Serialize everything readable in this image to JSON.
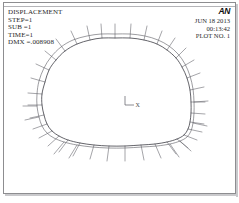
{
  "window": {
    "title": "ANSYS Displacement Plot"
  },
  "legend": {
    "lines": [
      "DISPLACEMENT",
      "STEP=1",
      "SUB =1",
      "TIME=1",
      "DMX =.008908"
    ],
    "title": "DISPLACEMENT",
    "step": "STEP=1",
    "sub": "SUB =1",
    "time": "TIME=1",
    "dmx": "DMX =.008908"
  },
  "stamp": {
    "logo": "AN",
    "date": "JUN 18 2013",
    "time": "00:13:42",
    "plot_no": "PLOT NO.   1"
  },
  "axis_triad": {
    "x_label": "X",
    "origin_x": 121,
    "origin_y": 98,
    "arm_length": 9
  },
  "colors": {
    "line": "#5a5a62",
    "line_dark": "#3c3c44",
    "border": "#8d8d90",
    "border_shadow": "#c9c9cc",
    "text": "#2a2a2a",
    "background": "#ffffff"
  },
  "chart_data": {
    "type": "line",
    "title": "DISPLACEMENT",
    "description": "ANSYS deformed-shape plot of a horseshoe tunnel cross-section with radial rock-bolt elements",
    "xlabel": "X",
    "ylabel": "",
    "legend_position": "top-left",
    "grid": false,
    "viewbox": [
      0,
      0,
      231,
      186
    ],
    "series": [
      {
        "name": "undeformed-outline",
        "closed": true,
        "points": [
          [
            111,
            27
          ],
          [
            126,
            27
          ],
          [
            141,
            29
          ],
          [
            154,
            33
          ],
          [
            165,
            39
          ],
          [
            174,
            47
          ],
          [
            181,
            57
          ],
          [
            186,
            69
          ],
          [
            189,
            82
          ],
          [
            190,
            95
          ],
          [
            190,
            106
          ],
          [
            189,
            116
          ],
          [
            187,
            124
          ],
          [
            183,
            130
          ],
          [
            176,
            134
          ],
          [
            166,
            137
          ],
          [
            153,
            139
          ],
          [
            138,
            140
          ],
          [
            121,
            141
          ],
          [
            104,
            141
          ],
          [
            88,
            140
          ],
          [
            73,
            138
          ],
          [
            60,
            135
          ],
          [
            50,
            131
          ],
          [
            43,
            126
          ],
          [
            38,
            119
          ],
          [
            35,
            110
          ],
          [
            33,
            99
          ],
          [
            33,
            87
          ],
          [
            35,
            74
          ],
          [
            40,
            61
          ],
          [
            47,
            50
          ],
          [
            57,
            40
          ],
          [
            69,
            33
          ],
          [
            83,
            29
          ],
          [
            97,
            27
          ]
        ]
      },
      {
        "name": "deformed-outline",
        "closed": true,
        "points": [
          [
            111,
            31
          ],
          [
            126,
            31
          ],
          [
            140,
            33
          ],
          [
            153,
            37
          ],
          [
            163,
            43
          ],
          [
            172,
            51
          ],
          [
            178,
            60
          ],
          [
            183,
            71
          ],
          [
            186,
            83
          ],
          [
            187,
            95
          ],
          [
            187,
            106
          ],
          [
            186,
            115
          ],
          [
            184,
            122
          ],
          [
            180,
            128
          ],
          [
            173,
            132
          ],
          [
            163,
            135
          ],
          [
            151,
            137
          ],
          [
            137,
            138
          ],
          [
            121,
            139
          ],
          [
            105,
            139
          ],
          [
            90,
            138
          ],
          [
            76,
            136
          ],
          [
            64,
            133
          ],
          [
            55,
            129
          ],
          [
            48,
            124
          ],
          [
            43,
            117
          ],
          [
            40,
            108
          ],
          [
            38,
            98
          ],
          [
            38,
            87
          ],
          [
            41,
            75
          ],
          [
            45,
            63
          ],
          [
            52,
            53
          ],
          [
            61,
            44
          ],
          [
            73,
            37
          ],
          [
            86,
            33
          ],
          [
            98,
            31
          ]
        ]
      }
    ],
    "bolts": {
      "name": "rock-bolt-elements",
      "count": 44,
      "lines": [
        [
          [
            111,
            31
          ],
          [
            111,
            17
          ]
        ],
        [
          [
            126,
            31
          ],
          [
            127,
            17
          ]
        ],
        [
          [
            140,
            33
          ],
          [
            143,
            19
          ]
        ],
        [
          [
            153,
            37
          ],
          [
            158,
            24
          ]
        ],
        [
          [
            163,
            43
          ],
          [
            171,
            31
          ]
        ],
        [
          [
            172,
            51
          ],
          [
            182,
            41
          ]
        ],
        [
          [
            178,
            60
          ],
          [
            190,
            53
          ]
        ],
        [
          [
            183,
            71
          ],
          [
            196,
            66
          ]
        ],
        [
          [
            186,
            83
          ],
          [
            200,
            80
          ]
        ],
        [
          [
            187,
            95
          ],
          [
            201,
            95
          ]
        ],
        [
          [
            187,
            106
          ],
          [
            201,
            107
          ]
        ],
        [
          [
            186,
            115
          ],
          [
            200,
            117
          ]
        ],
        [
          [
            184,
            122
          ],
          [
            198,
            125
          ]
        ],
        [
          [
            180,
            128
          ],
          [
            193,
            133
          ]
        ],
        [
          [
            173,
            132
          ],
          [
            184,
            141
          ]
        ],
        [
          [
            163,
            135
          ],
          [
            172,
            147
          ]
        ],
        [
          [
            151,
            137
          ],
          [
            157,
            151
          ]
        ],
        [
          [
            137,
            138
          ],
          [
            140,
            153
          ]
        ],
        [
          [
            121,
            139
          ],
          [
            121,
            154
          ]
        ],
        [
          [
            105,
            139
          ],
          [
            103,
            154
          ]
        ],
        [
          [
            90,
            138
          ],
          [
            86,
            152
          ]
        ],
        [
          [
            76,
            136
          ],
          [
            69,
            149
          ]
        ],
        [
          [
            64,
            133
          ],
          [
            55,
            145
          ]
        ],
        [
          [
            55,
            129
          ],
          [
            44,
            139
          ]
        ],
        [
          [
            48,
            124
          ],
          [
            35,
            131
          ]
        ],
        [
          [
            43,
            117
          ],
          [
            29,
            122
          ]
        ],
        [
          [
            40,
            108
          ],
          [
            26,
            111
          ]
        ],
        [
          [
            38,
            98
          ],
          [
            24,
            98
          ]
        ],
        [
          [
            38,
            87
          ],
          [
            24,
            86
          ]
        ],
        [
          [
            41,
            75
          ],
          [
            27,
            71
          ]
        ],
        [
          [
            45,
            63
          ],
          [
            32,
            57
          ]
        ],
        [
          [
            52,
            53
          ],
          [
            41,
            44
          ]
        ],
        [
          [
            61,
            44
          ],
          [
            52,
            32
          ]
        ],
        [
          [
            73,
            37
          ],
          [
            67,
            24
          ]
        ],
        [
          [
            86,
            33
          ],
          [
            83,
            19
          ]
        ],
        [
          [
            98,
            31
          ],
          [
            97,
            17
          ]
        ],
        [
          [
            33,
            99
          ],
          [
            19,
            99
          ]
        ],
        [
          [
            35,
            110
          ],
          [
            21,
            113
          ]
        ],
        [
          [
            190,
            95
          ],
          [
            204,
            94
          ]
        ],
        [
          [
            189,
            116
          ],
          [
            203,
            119
          ]
        ],
        [
          [
            166,
            137
          ],
          [
            175,
            150
          ]
        ],
        [
          [
            73,
            138
          ],
          [
            65,
            151
          ]
        ],
        [
          [
            176,
            134
          ],
          [
            187,
            144
          ]
        ],
        [
          [
            60,
            135
          ],
          [
            50,
            147
          ]
        ]
      ]
    }
  }
}
